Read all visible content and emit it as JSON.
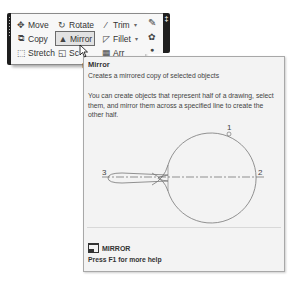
{
  "ribbon": {
    "panel_title": "M",
    "tools": [
      {
        "id": "move",
        "label": "Move",
        "icon": "move-icon"
      },
      {
        "id": "rotate",
        "label": "Rotate",
        "icon": "rotate-icon"
      },
      {
        "id": "trim",
        "label": "Trim",
        "icon": "trim-icon",
        "dropdown": "▾"
      },
      {
        "id": "copy",
        "label": "Copy",
        "icon": "copy-icon"
      },
      {
        "id": "mirror",
        "label": "Mirror",
        "icon": "mirror-icon",
        "active": true
      },
      {
        "id": "fillet",
        "label": "Fillet",
        "icon": "fillet-icon",
        "dropdown": "▾"
      },
      {
        "id": "stretch",
        "label": "Stretch",
        "icon": "stretch-icon"
      },
      {
        "id": "scale",
        "label": "Sc",
        "icon": "scale-icon"
      },
      {
        "id": "array",
        "label": "Arr",
        "icon": "array-icon"
      }
    ],
    "right_grip_pin": "‡"
  },
  "tooltip": {
    "title": "Mirror",
    "short_description": "Creates a mirrored copy of selected objects",
    "long_description": "You can create objects that represent half of a drawing, select them, and mirror them across a specified line to create the other half.",
    "illustration": {
      "labels": [
        "1",
        "2",
        "3"
      ]
    },
    "command_name": "MIRROR",
    "help_hint": "Press F1 for more help"
  },
  "colors": {
    "ribbon_bg": "#f7f7f7",
    "tooltip_bg": "#f3f3f3",
    "grip": "#1f1f1f"
  }
}
